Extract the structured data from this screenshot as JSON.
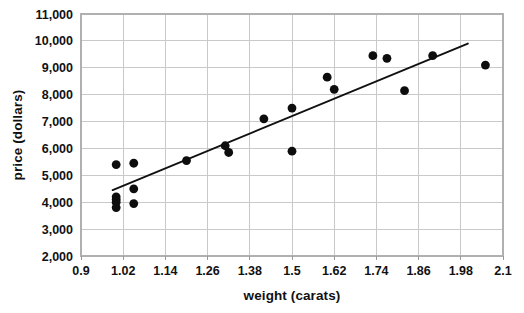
{
  "chart_data": {
    "type": "scatter",
    "title": "",
    "xlabel": "weight (carats)",
    "ylabel": "price (dollars)",
    "xlim": [
      0.9,
      2.1
    ],
    "ylim": [
      2000,
      11000
    ],
    "xticks": [
      0.9,
      1.02,
      1.14,
      1.26,
      1.38,
      1.5,
      1.62,
      1.74,
      1.86,
      1.98,
      2.1
    ],
    "xtick_labels": [
      "0.9",
      "1.02",
      "1.14",
      "1.26",
      "1.38",
      "1.5",
      "1.62",
      "1.74",
      "1.86",
      "1.98",
      "2.1"
    ],
    "yticks": [
      2000,
      3000,
      4000,
      5000,
      6000,
      7000,
      8000,
      9000,
      10000,
      11000
    ],
    "ytick_labels": [
      "2,000",
      "3,000",
      "4,000",
      "5,000",
      "6,000",
      "7,000",
      "8,000",
      "9,000",
      "10,000",
      "11,000"
    ],
    "grid": true,
    "grid_axis": "both",
    "legend": false,
    "marker": "filled-circle",
    "marker_color": "#0d0d0d",
    "marker_size_px": 4.4,
    "points": [
      {
        "x": 1.0,
        "y": 5400
      },
      {
        "x": 1.0,
        "y": 4200
      },
      {
        "x": 1.0,
        "y": 4100
      },
      {
        "x": 1.0,
        "y": 4000
      },
      {
        "x": 1.0,
        "y": 3800
      },
      {
        "x": 1.05,
        "y": 5450
      },
      {
        "x": 1.05,
        "y": 4500
      },
      {
        "x": 1.05,
        "y": 3950
      },
      {
        "x": 1.2,
        "y": 5550
      },
      {
        "x": 1.31,
        "y": 6100
      },
      {
        "x": 1.32,
        "y": 5850
      },
      {
        "x": 1.42,
        "y": 7100
      },
      {
        "x": 1.5,
        "y": 7500
      },
      {
        "x": 1.5,
        "y": 5900
      },
      {
        "x": 1.6,
        "y": 8650
      },
      {
        "x": 1.62,
        "y": 8200
      },
      {
        "x": 1.73,
        "y": 9450
      },
      {
        "x": 1.77,
        "y": 9350
      },
      {
        "x": 1.82,
        "y": 8150
      },
      {
        "x": 1.9,
        "y": 9450
      },
      {
        "x": 2.05,
        "y": 9100
      }
    ],
    "trendline": {
      "label": "least-squares line",
      "x_start": 0.99,
      "y_start": 4450,
      "x_end": 2.0,
      "y_end": 9900,
      "color": "#111111"
    }
  }
}
